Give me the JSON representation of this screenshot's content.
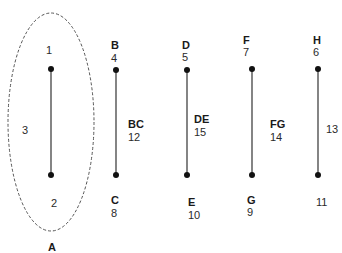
{
  "diagram": {
    "ellipse": {
      "label": "A",
      "cx": 51,
      "cy": 122,
      "rx": 43,
      "ry": 109
    },
    "ellipse_labels": {
      "top": "1",
      "bottom": "2",
      "left": "3"
    },
    "edges": [
      {
        "id": "A-edge",
        "x": 51,
        "y1": 69,
        "y2": 175,
        "top_name": "",
        "top_num": "1",
        "bottom_name": "",
        "bottom_num": "2",
        "mid_name": "",
        "mid_num": "3"
      },
      {
        "id": "BC",
        "x": 116,
        "y1": 70,
        "y2": 175,
        "top_name": "B",
        "top_num": "4",
        "bottom_name": "C",
        "bottom_num": "8",
        "mid_name": "BC",
        "mid_num": "12"
      },
      {
        "id": "DE",
        "x": 187,
        "y1": 70,
        "y2": 175,
        "top_name": "D",
        "top_num": "5",
        "bottom_name": "E",
        "bottom_num": "10",
        "mid_name": "DE",
        "mid_num": "15"
      },
      {
        "id": "FG",
        "x": 252,
        "y1": 69,
        "y2": 175,
        "top_name": "F",
        "top_num": "7",
        "bottom_name": "G",
        "bottom_num": "9",
        "mid_name": "FG",
        "mid_num": "14"
      },
      {
        "id": "H",
        "x": 318,
        "y1": 69,
        "y2": 175,
        "top_name": "H",
        "top_num": "6",
        "bottom_name": "",
        "bottom_num": "11",
        "mid_name": "",
        "mid_num": "13"
      }
    ],
    "colors": {
      "line": "#333333",
      "dot": "#111111",
      "ellipse_stroke": "#555555"
    }
  }
}
